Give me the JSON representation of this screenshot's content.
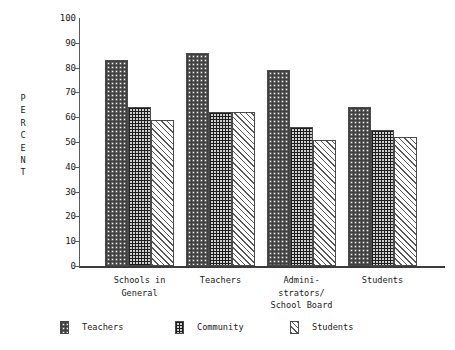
{
  "chart_data": {
    "type": "bar",
    "title": "",
    "xlabel": "",
    "ylabel": "PERCENT",
    "ylim": [
      0,
      100
    ],
    "ytick_step": 10,
    "grid": false,
    "legend_position": "bottom",
    "yticks": [
      "100",
      "90",
      "80",
      "70",
      "60",
      "50",
      "40",
      "30",
      "20",
      "10",
      "0"
    ],
    "ytick_values": [
      100,
      90,
      80,
      70,
      60,
      50,
      40,
      30,
      20,
      10,
      0
    ],
    "categories": [
      "Schools in\nGeneral",
      "Teachers",
      "Admini-\nstrators/\nSchool Board",
      "Students"
    ],
    "series": [
      {
        "name": "Teachers",
        "pattern": "checkerboard",
        "values": [
          83,
          86,
          79,
          64
        ]
      },
      {
        "name": "Community",
        "pattern": "dense-grid",
        "values": [
          64,
          62,
          56,
          55
        ]
      },
      {
        "name": "Students",
        "pattern": "diagonal-hatch",
        "values": [
          59,
          62,
          51,
          52
        ]
      }
    ],
    "axis_color": "#3b3b3b"
  },
  "axis": {
    "y_title_letters": [
      "P",
      "E",
      "R",
      "C",
      "E",
      "N",
      "T"
    ]
  },
  "legend": {
    "items": [
      {
        "label": "Teachers"
      },
      {
        "label": "Community"
      },
      {
        "label": "Students"
      }
    ]
  }
}
